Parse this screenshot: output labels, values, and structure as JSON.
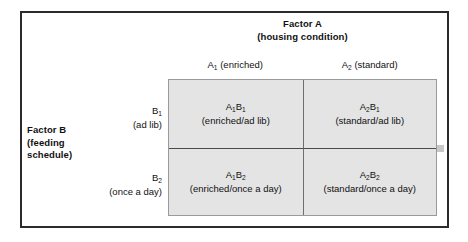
{
  "figure": {
    "column_factor": {
      "title": "Factor A",
      "subtitle": "(housing condition)",
      "levels": [
        {
          "code": "A",
          "sub": "1",
          "label": "(enriched)"
        },
        {
          "code": "A",
          "sub": "2",
          "label": "(standard)"
        }
      ]
    },
    "row_factor": {
      "title": "Factor B",
      "subtitle_line1": "(feeding",
      "subtitle_line2": "schedule)",
      "levels": [
        {
          "code": "B",
          "sub": "1",
          "label": "(ad lib)"
        },
        {
          "code": "B",
          "sub": "2",
          "label": "(once a day)"
        }
      ]
    },
    "cells": [
      {
        "code_a": "A",
        "sub_a": "1",
        "code_b": "B",
        "sub_b": "1",
        "description": "(enriched/ad lib)"
      },
      {
        "code_a": "A",
        "sub_a": "2",
        "code_b": "B",
        "sub_b": "1",
        "description": "(standard/ad lib)"
      },
      {
        "code_a": "A",
        "sub_a": "1",
        "code_b": "B",
        "sub_b": "2",
        "description": "(enriched/once a day)"
      },
      {
        "code_a": "A",
        "sub_a": "2",
        "code_b": "B",
        "sub_b": "2",
        "description": "(standard/once a day)"
      }
    ],
    "colors": {
      "cell_fill": "#e4e4e4",
      "frame": "#2b2b2b",
      "grid_line": "#6f6f6f",
      "text": "#111111"
    }
  }
}
